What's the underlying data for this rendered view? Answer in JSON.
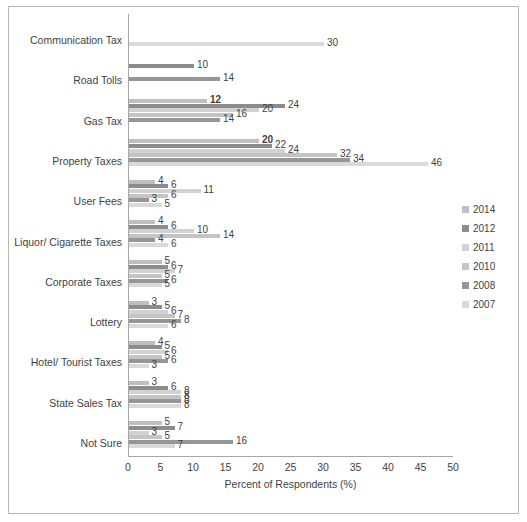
{
  "chart_data": {
    "type": "bar",
    "orientation": "horizontal",
    "title": "",
    "xlabel": "Percent of Respondents (%)",
    "ylabel": "",
    "xlim": [
      0,
      50
    ],
    "xticks": [
      0,
      5,
      10,
      15,
      20,
      25,
      30,
      35,
      40,
      45,
      50
    ],
    "grid": false,
    "legend_position": "right",
    "categories": [
      "Communication Tax",
      "Road Tolls",
      "Gas Tax",
      "Property Taxes",
      "User Fees",
      "Liquor/ Cigarette Taxes",
      "Corporate Taxes",
      "Lottery",
      "Hotel/ Tourist Taxes",
      "State Sales Tax",
      "Not Sure"
    ],
    "series": [
      {
        "name": "2014",
        "color": "#bfbfbf",
        "values": [
          null,
          null,
          12,
          20,
          4,
          4,
          5,
          3,
          4,
          3,
          5
        ]
      },
      {
        "name": "2012",
        "color": "#8c8c8c",
        "values": [
          null,
          10,
          24,
          22,
          6,
          6,
          6,
          5,
          5,
          6,
          7
        ]
      },
      {
        "name": "2011",
        "color": "#d2d2d2",
        "values": [
          null,
          null,
          20,
          24,
          11,
          10,
          7,
          6,
          6,
          8,
          3
        ]
      },
      {
        "name": "2010",
        "color": "#c4c4c4",
        "values": [
          null,
          null,
          16,
          32,
          6,
          14,
          5,
          7,
          5,
          8,
          5
        ]
      },
      {
        "name": "2008",
        "color": "#969696",
        "values": [
          null,
          14,
          14,
          34,
          3,
          4,
          6,
          8,
          6,
          8,
          16
        ]
      },
      {
        "name": "2007",
        "color": "#d9d9d9",
        "values": [
          30,
          null,
          null,
          46,
          5,
          6,
          5,
          6,
          3,
          8,
          7
        ]
      }
    ],
    "bold_labels": [
      "12",
      "20",
      "10"
    ],
    "legend_entries": [
      "2014",
      "2012",
      "2011",
      "2010",
      "2008",
      "2007"
    ]
  }
}
